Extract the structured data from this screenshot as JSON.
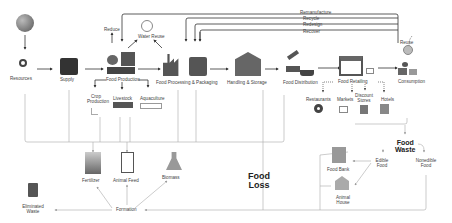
{
  "diagram": {
    "title_nodes": {
      "food_loss": "Food\nLoss",
      "food_waste": "Food\nWaste"
    },
    "main_chain": [
      {
        "id": "resources",
        "label": "Resources"
      },
      {
        "id": "supply",
        "label": "Supply"
      },
      {
        "id": "food_production",
        "label": "Food Production"
      },
      {
        "id": "food_processing",
        "label": "Food Processing & Packaging"
      },
      {
        "id": "handling_storage",
        "label": "Handling & Storage"
      },
      {
        "id": "food_distribution",
        "label": "Food Distribution"
      },
      {
        "id": "food_retailing",
        "label": "Food Retailing"
      },
      {
        "id": "consumption",
        "label": "Consumption"
      }
    ],
    "production_branches": [
      "Crop Production",
      "Livestock",
      "Aquaculture"
    ],
    "production_top": {
      "reduce": "Reduce",
      "water_reuse": "Water Reuse"
    },
    "feedback_loops": [
      "Remanufacture",
      "Recycle",
      "Redesign",
      "Recover"
    ],
    "consumption_loop": "Reuse",
    "retail_branches": [
      "Restaurants",
      "Markets",
      "Discount Stores",
      "Hotels"
    ],
    "recovery_products": [
      "Fertilizer",
      "Animal Feed",
      "Biomass"
    ],
    "formation": "Formation",
    "eliminated_waste": "Eliminated Waste",
    "food_waste_branches": {
      "edible": "Edible Food",
      "nonedible": "Nonedible Food"
    },
    "edible_destinations": [
      "Food Bank",
      "Animal House"
    ]
  }
}
